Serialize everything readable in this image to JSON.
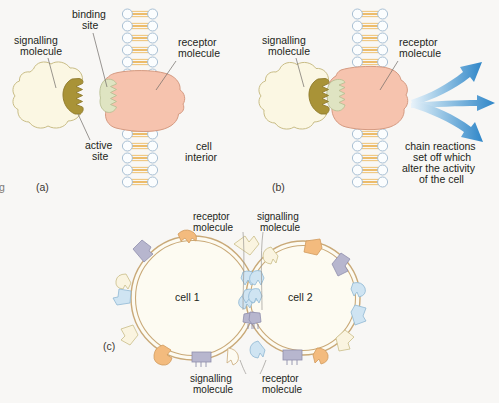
{
  "figure": {
    "background_color": "#f8f7f5",
    "cut_off_text_left": "g"
  },
  "palette": {
    "signalling_molecule_fill": "#fbf7e3",
    "signalling_molecule_stroke": "#c9bd86",
    "active_site_fill": "#a99337",
    "active_site_stroke": "#8e7b2c",
    "receptor_fill": "#f6c3ae",
    "receptor_stroke": "#d59a81",
    "binding_site_fill": "#dfe4c2",
    "binding_site_stroke": "#b9bf93",
    "membrane_head_fill": "#fbfdfe",
    "membrane_head_stroke": "#9fb9cf",
    "membrane_tail_color": "#e8a93c",
    "arrow_blue": "#2f86c8",
    "arrow_blue_pale": "#d8e9f6",
    "cell_membrane_outer": "#c9a978",
    "cell_interior_fill": "#fdfbf2",
    "protein_orange": "#f3bb7e",
    "protein_blue": "#cfe4f2",
    "protein_lavender": "#b7b6ce",
    "protein_cream": "#faf4e0",
    "text_color": "#231f20"
  },
  "panel_a": {
    "id": "(a)",
    "labels": {
      "signalling_molecule": [
        "signalling",
        "molecule"
      ],
      "binding_site": [
        "binding",
        "site"
      ],
      "receptor_molecule": [
        "receptor",
        "molecule"
      ],
      "active_site": [
        "active",
        "site"
      ],
      "cell_interior": [
        "cell",
        "interior"
      ]
    }
  },
  "panel_b": {
    "id": "(b)",
    "labels": {
      "signalling_molecule": [
        "signalling",
        "molecule"
      ],
      "receptor_molecule": [
        "receptor",
        "molecule"
      ],
      "chain_reactions": [
        "chain reactions",
        "set off which",
        "alter the activity",
        "of the cell"
      ]
    },
    "arrow_count": 3
  },
  "panel_c": {
    "id": "(c)",
    "labels": {
      "top_left": [
        "receptor",
        "molecule"
      ],
      "top_right": [
        "signalling",
        "molecule"
      ],
      "bottom_left": [
        "signalling",
        "molecule"
      ],
      "bottom_right": [
        "receptor",
        "molecule"
      ],
      "cell_1": "cell 1",
      "cell_2": "cell 2"
    }
  }
}
